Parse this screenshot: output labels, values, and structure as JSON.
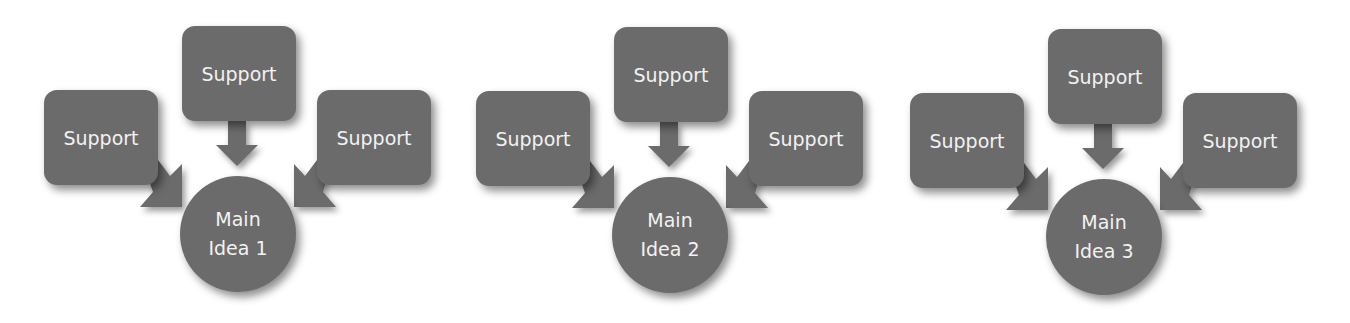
{
  "diagram": {
    "type": "hub-and-spoke",
    "colors": {
      "shape_fill": "#6b6b6b",
      "text": "#f2f2f2",
      "background": "#ffffff"
    },
    "groups": [
      {
        "main": {
          "line1": "Main",
          "line2": "Idea 1"
        },
        "supports": {
          "top": "Support",
          "left": "Support",
          "right": "Support"
        }
      },
      {
        "main": {
          "line1": "Main",
          "line2": "Idea 2"
        },
        "supports": {
          "top": "Support",
          "left": "Support",
          "right": "Support"
        }
      },
      {
        "main": {
          "line1": "Main",
          "line2": "Idea 3"
        },
        "supports": {
          "top": "Support",
          "left": "Support",
          "right": "Support"
        }
      }
    ],
    "edges": [
      {
        "from": "top",
        "to": "main"
      },
      {
        "from": "left",
        "to": "main"
      },
      {
        "from": "right",
        "to": "main"
      }
    ]
  }
}
